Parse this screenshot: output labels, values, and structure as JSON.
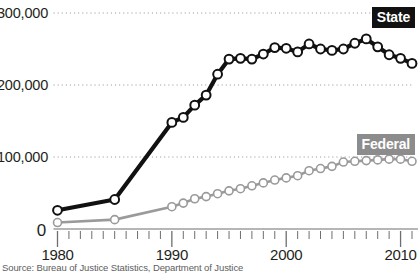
{
  "chart_data": {
    "type": "line",
    "title": "",
    "subtitle": "",
    "xlabel": "",
    "ylabel": "",
    "xlim": [
      1980,
      2011
    ],
    "ylim": [
      0,
      300000
    ],
    "grid": true,
    "grid_axis": "y",
    "legend_position": "inside-right",
    "x_tick_labels": [
      "1980",
      "1990",
      "2000",
      "2010"
    ],
    "x_tick_values": [
      1980,
      1990,
      2000,
      2010
    ],
    "x_minor_tick_interval": 1,
    "y_tick_labels": [
      "300,000",
      "200,000",
      "100,000",
      "0"
    ],
    "y_tick_values": [
      300000,
      200000,
      100000,
      0
    ],
    "series": [
      {
        "name": "State",
        "color": "#111111",
        "marker": "circle-open",
        "x": [
          1980,
          1985,
          1990,
          1991,
          1992,
          1993,
          1994,
          1995,
          1996,
          1997,
          1998,
          1999,
          2000,
          2001,
          2002,
          2003,
          2004,
          2005,
          2006,
          2007,
          2008,
          2009,
          2010,
          2011
        ],
        "values": [
          26000,
          41000,
          148000,
          155000,
          172000,
          186000,
          215000,
          236000,
          237000,
          236000,
          243000,
          252000,
          251000,
          246000,
          257000,
          250000,
          248000,
          250000,
          258000,
          264000,
          253000,
          242000,
          237000,
          230000
        ]
      },
      {
        "name": "Federal",
        "color": "#9a9a9a",
        "marker": "circle-open",
        "x": [
          1980,
          1985,
          1990,
          1991,
          1992,
          1993,
          1994,
          1995,
          1996,
          1997,
          1998,
          1999,
          2000,
          2001,
          2002,
          2003,
          2004,
          2005,
          2006,
          2007,
          2008,
          2009,
          2010,
          2011
        ],
        "values": [
          9000,
          13000,
          31000,
          36000,
          42000,
          45000,
          49000,
          53000,
          56000,
          60000,
          64000,
          68000,
          71000,
          74000,
          81000,
          84000,
          87000,
          93000,
          94000,
          95000,
          96000,
          97000,
          97000,
          94000
        ]
      }
    ]
  },
  "y_axis": {
    "labels": [
      {
        "text": "300,000",
        "value": 300000
      },
      {
        "text": "200,000",
        "value": 200000
      },
      {
        "text": "100,000",
        "value": 100000
      },
      {
        "text": "0",
        "value": 0
      }
    ]
  },
  "x_axis": {
    "labels": [
      {
        "text": "1980",
        "value": 1980
      },
      {
        "text": "1990",
        "value": 1990
      },
      {
        "text": "2000",
        "value": 2000
      },
      {
        "text": "2010",
        "value": 2010
      }
    ]
  },
  "legend": {
    "state_label": "State",
    "federal_label": "Federal",
    "state_color": "#111111",
    "federal_color": "#8c8c8c"
  },
  "footer": {
    "source": "Source: Bureau of Justice Statistics, Department of Justice"
  }
}
